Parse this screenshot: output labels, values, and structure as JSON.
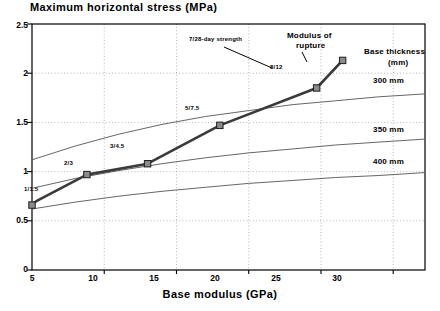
{
  "chart_data": {
    "type": "line",
    "title": "Maximum horizontal stress (MPa)",
    "xlabel": "Base modulus (GPa)",
    "ylabel": "Maximum horizontal stress (MPa)",
    "xlim": [
      5,
      32.2
    ],
    "ylim": [
      0,
      2.5
    ],
    "xticks": [
      5,
      10,
      15,
      20,
      25,
      30
    ],
    "yticks": [
      0,
      0.5,
      1,
      1.5,
      2,
      2.5
    ],
    "xticklabels": [
      "5",
      "10",
      "15",
      "20",
      "25",
      "30"
    ],
    "yticklabels": [
      "0",
      "0.5",
      "1",
      "1.5",
      "2",
      "2.5"
    ],
    "grid": "dotted-both",
    "legend_position": "right-inline",
    "series": [
      {
        "name": "7/28-day strength",
        "style": "thick-line-with-square-markers",
        "marker": "square",
        "points": [
          {
            "x": 5.0,
            "y": 0.66,
            "label": "1/1.5"
          },
          {
            "x": 5.3,
            "y": 0.7,
            "label": ""
          },
          {
            "x": 8.8,
            "y": 0.97,
            "label": "2/3"
          },
          {
            "x": 13.0,
            "y": 1.08,
            "label": "3/4.5"
          },
          {
            "x": 18.0,
            "y": 1.47,
            "label": "5/7.5"
          },
          {
            "x": 24.7,
            "y": 1.85,
            "label": "8/12"
          },
          {
            "x": 26.5,
            "y": 2.13,
            "label": ""
          }
        ]
      },
      {
        "name": "300 mm",
        "style": "thin-line",
        "points": [
          {
            "x": 5,
            "y": 1.12
          },
          {
            "x": 8,
            "y": 1.26
          },
          {
            "x": 11,
            "y": 1.38
          },
          {
            "x": 14,
            "y": 1.48
          },
          {
            "x": 17,
            "y": 1.56
          },
          {
            "x": 20,
            "y": 1.62
          },
          {
            "x": 23,
            "y": 1.68
          },
          {
            "x": 26,
            "y": 1.72
          },
          {
            "x": 29,
            "y": 1.76
          },
          {
            "x": 32.2,
            "y": 1.79
          }
        ]
      },
      {
        "name": "350 mm",
        "style": "thin-line",
        "points": [
          {
            "x": 5,
            "y": 0.83
          },
          {
            "x": 8,
            "y": 0.93
          },
          {
            "x": 11,
            "y": 1.01
          },
          {
            "x": 14,
            "y": 1.08
          },
          {
            "x": 17,
            "y": 1.14
          },
          {
            "x": 20,
            "y": 1.19
          },
          {
            "x": 23,
            "y": 1.23
          },
          {
            "x": 26,
            "y": 1.27
          },
          {
            "x": 29,
            "y": 1.3
          },
          {
            "x": 32.2,
            "y": 1.33
          }
        ]
      },
      {
        "name": "400 mm",
        "style": "thin-line",
        "points": [
          {
            "x": 5,
            "y": 0.62
          },
          {
            "x": 8,
            "y": 0.69
          },
          {
            "x": 11,
            "y": 0.75
          },
          {
            "x": 14,
            "y": 0.8
          },
          {
            "x": 17,
            "y": 0.84
          },
          {
            "x": 20,
            "y": 0.88
          },
          {
            "x": 23,
            "y": 0.91
          },
          {
            "x": 26,
            "y": 0.94
          },
          {
            "x": 29,
            "y": 0.96
          },
          {
            "x": 32.2,
            "y": 0.99
          }
        ]
      }
    ],
    "annotations": {
      "strength_label": "7/28-day strength",
      "modulus_label_line1": "Modulus of",
      "modulus_label_line2": "rupture",
      "legend_title_line1": "Base thickness",
      "legend_title_line2": "(mm)",
      "legend_300": "300 mm",
      "legend_350": "350 mm",
      "legend_400": "400 mm",
      "point_labels": [
        "1/1.5",
        "2/3",
        "3/4.5",
        "5/7.5",
        "8/12"
      ]
    },
    "colors": {
      "axis": "#000000",
      "curve": "#3a3a3a",
      "thin_curve": "#555555",
      "grid": "#9a9a9a",
      "marker_fill": "#8a8a8a",
      "background": "#ffffff"
    }
  }
}
